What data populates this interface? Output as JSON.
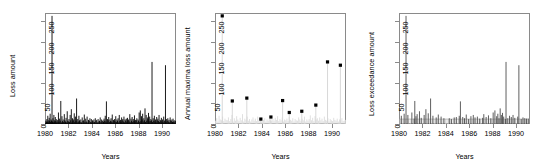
{
  "figure": {
    "kind": "multi-panel-statistical-plot",
    "panel_count": 3,
    "background": "#ffffff",
    "line_color": "#000000",
    "muted_color": "#c8c8c8",
    "axis_color": "#8a8a8a"
  },
  "chart_data": [
    {
      "type": "line",
      "panel_index": 0,
      "title": "",
      "xlabel": "Years",
      "ylabel": "Loss amount",
      "xlim": [
        1980,
        1991.2
      ],
      "ylim": [
        0,
        270
      ],
      "xticks": [
        1980,
        1982,
        1984,
        1986,
        1988,
        1990
      ],
      "yticks": [
        0,
        50,
        100,
        150,
        200,
        250
      ],
      "grid": false,
      "legend": "none",
      "series": [
        {
          "name": "Loss amount (all events)",
          "style": "impulse-spikes",
          "color": "#000000",
          "x": [
            1980.03,
            1980.08,
            1980.12,
            1980.16,
            1980.2,
            1980.24,
            1980.28,
            1980.32,
            1980.36,
            1980.4,
            1980.44,
            1980.48,
            1980.52,
            1980.56,
            1980.6,
            1980.64,
            1980.68,
            1980.72,
            1980.76,
            1980.8,
            1980.84,
            1980.88,
            1980.92,
            1980.96,
            1981.0,
            1981.05,
            1981.1,
            1981.15,
            1981.2,
            1981.25,
            1981.3,
            1981.35,
            1981.4,
            1981.45,
            1981.5,
            1981.55,
            1981.6,
            1981.65,
            1981.7,
            1981.75,
            1981.8,
            1981.85,
            1981.9,
            1981.95,
            1982.0,
            1982.05,
            1982.1,
            1982.15,
            1982.2,
            1982.25,
            1982.3,
            1982.35,
            1982.4,
            1982.45,
            1982.5,
            1982.55,
            1982.6,
            1982.65,
            1982.7,
            1982.75,
            1982.8,
            1982.85,
            1982.9,
            1982.95,
            1983.0,
            1983.06,
            1983.12,
            1983.18,
            1983.24,
            1983.3,
            1983.36,
            1983.42,
            1983.48,
            1983.54,
            1983.6,
            1983.66,
            1983.72,
            1983.78,
            1983.84,
            1983.9,
            1983.96,
            1984.0,
            1984.06,
            1984.12,
            1984.18,
            1984.24,
            1984.3,
            1984.36,
            1984.42,
            1984.48,
            1984.54,
            1984.6,
            1984.66,
            1984.72,
            1984.78,
            1984.84,
            1984.9,
            1984.96,
            1985.0,
            1985.05,
            1985.1,
            1985.15,
            1985.2,
            1985.25,
            1985.3,
            1985.35,
            1985.4,
            1985.45,
            1985.5,
            1985.55,
            1985.6,
            1985.65,
            1985.7,
            1985.75,
            1985.8,
            1985.85,
            1985.9,
            1985.95,
            1986.0,
            1986.05,
            1986.1,
            1986.15,
            1986.2,
            1986.25,
            1986.3,
            1986.35,
            1986.4,
            1986.45,
            1986.5,
            1986.55,
            1986.6,
            1986.65,
            1986.7,
            1986.75,
            1986.8,
            1986.85,
            1986.9,
            1986.95,
            1987.0,
            1987.05,
            1987.1,
            1987.15,
            1987.2,
            1987.25,
            1987.3,
            1987.35,
            1987.4,
            1987.45,
            1987.5,
            1987.55,
            1987.6,
            1987.65,
            1987.7,
            1987.75,
            1987.8,
            1987.85,
            1987.9,
            1987.95,
            1988.0,
            1988.05,
            1988.1,
            1988.15,
            1988.2,
            1988.25,
            1988.3,
            1988.35,
            1988.4,
            1988.45,
            1988.5,
            1988.55,
            1988.6,
            1988.65,
            1988.7,
            1988.75,
            1988.8,
            1988.85,
            1988.9,
            1988.95,
            1989.0,
            1989.05,
            1989.1,
            1989.15,
            1989.2,
            1989.25,
            1989.3,
            1989.35,
            1989.4,
            1989.45,
            1989.5,
            1989.55,
            1989.6,
            1989.65,
            1989.7,
            1989.75,
            1989.8,
            1989.85,
            1989.9,
            1989.95,
            1990.0,
            1990.05,
            1990.1,
            1990.15,
            1990.2,
            1990.25,
            1990.3,
            1990.35,
            1990.4,
            1990.45,
            1990.5,
            1990.55,
            1990.6,
            1990.65,
            1990.7,
            1990.75,
            1990.8,
            1990.85,
            1990.9,
            1990.95,
            1991.0,
            1991.05,
            1991.1,
            1991.15
          ],
          "y": [
            3,
            8,
            5,
            12,
            6,
            20,
            4,
            9,
            15,
            7,
            25,
            5,
            11,
            8,
            263,
            6,
            14,
            4,
            22,
            9,
            5,
            17,
            7,
            12,
            4,
            10,
            6,
            28,
            5,
            13,
            8,
            56,
            4,
            19,
            7,
            11,
            5,
            24,
            9,
            6,
            15,
            4,
            31,
            8,
            6,
            12,
            5,
            22,
            9,
            36,
            4,
            14,
            7,
            11,
            26,
            5,
            18,
            8,
            62,
            4,
            12,
            6,
            20,
            9,
            5,
            11,
            4,
            16,
            7,
            9,
            23,
            5,
            13,
            6,
            18,
            4,
            10,
            8,
            14,
            5,
            12,
            4,
            9,
            6,
            11,
            5,
            14,
            7,
            10,
            4,
            12,
            6,
            8,
            16,
            5,
            11,
            7,
            9,
            5,
            13,
            8,
            20,
            6,
            55,
            4,
            12,
            9,
            17,
            5,
            11,
            7,
            14,
            6,
            23,
            4,
            10,
            8,
            12,
            6,
            19,
            5,
            11,
            8,
            14,
            4,
            22,
            7,
            10,
            5,
            16,
            9,
            12,
            6,
            18,
            4,
            11,
            8,
            13,
            5,
            15,
            9,
            11,
            6,
            24,
            4,
            13,
            8,
            17,
            5,
            12,
            7,
            21,
            6,
            10,
            9,
            14,
            4,
            11,
            8,
            28,
            5,
            33,
            7,
            19,
            11,
            25,
            6,
            14,
            9,
            38,
            5,
            22,
            8,
            16,
            12,
            27,
            6,
            18,
            7,
            12,
            9,
            151,
            5,
            14,
            8,
            20,
            6,
            11,
            4,
            17,
            9,
            13,
            7,
            22,
            5,
            10,
            8,
            15,
            6,
            11,
            4,
            18,
            7,
            9,
            143,
            5,
            12,
            8,
            14,
            6,
            10,
            4,
            16,
            9,
            7,
            11,
            5,
            13,
            6,
            9,
            4,
            8
          ]
        }
      ]
    },
    {
      "type": "scatter",
      "panel_index": 1,
      "title": "",
      "xlabel": "Years",
      "ylabel": "Annual maxima loss amount",
      "xlim": [
        1980,
        1991.2
      ],
      "ylim": [
        0,
        270
      ],
      "xticks": [
        1980,
        1982,
        1984,
        1986,
        1988,
        1990
      ],
      "yticks": [
        0,
        50,
        100,
        150,
        200,
        250
      ],
      "grid": false,
      "legend": "none",
      "series": [
        {
          "name": "Background losses (muted)",
          "style": "impulse-spikes",
          "color": "#dcdcdc",
          "x": [
            1980.05,
            1980.15,
            1980.25,
            1980.35,
            1980.45,
            1980.55,
            1980.65,
            1980.75,
            1980.85,
            1980.95,
            1981.05,
            1981.15,
            1981.25,
            1981.35,
            1981.45,
            1981.55,
            1981.65,
            1981.75,
            1981.85,
            1981.95,
            1982.05,
            1982.15,
            1982.25,
            1982.35,
            1982.45,
            1982.55,
            1982.65,
            1982.75,
            1982.85,
            1982.95,
            1983.05,
            1983.15,
            1983.25,
            1983.35,
            1983.45,
            1983.55,
            1983.65,
            1983.75,
            1983.85,
            1983.95,
            1984.05,
            1984.15,
            1984.25,
            1984.35,
            1984.45,
            1984.55,
            1984.65,
            1984.75,
            1984.85,
            1984.95,
            1985.05,
            1985.15,
            1985.25,
            1985.35,
            1985.45,
            1985.55,
            1985.65,
            1985.75,
            1985.85,
            1985.95,
            1986.05,
            1986.15,
            1986.25,
            1986.35,
            1986.45,
            1986.55,
            1986.65,
            1986.75,
            1986.85,
            1986.95,
            1987.05,
            1987.15,
            1987.25,
            1987.35,
            1987.45,
            1987.55,
            1987.65,
            1987.75,
            1987.85,
            1987.95,
            1988.05,
            1988.15,
            1988.25,
            1988.35,
            1988.45,
            1988.55,
            1988.65,
            1988.75,
            1988.85,
            1988.95,
            1989.05,
            1989.15,
            1989.25,
            1989.35,
            1989.45,
            1989.55,
            1989.65,
            1989.75,
            1989.85,
            1989.95,
            1990.05,
            1990.15,
            1990.25,
            1990.35,
            1990.45,
            1990.55,
            1990.65,
            1990.75,
            1990.85,
            1990.95,
            1991.05,
            1991.15
          ],
          "y": [
            8,
            14,
            6,
            20,
            11,
            9,
            18,
            7,
            13,
            10,
            9,
            16,
            7,
            12,
            22,
            6,
            14,
            8,
            19,
            11,
            7,
            15,
            9,
            24,
            6,
            13,
            10,
            18,
            8,
            12,
            6,
            11,
            16,
            8,
            13,
            7,
            18,
            9,
            12,
            6,
            7,
            10,
            14,
            6,
            11,
            8,
            13,
            9,
            7,
            12,
            8,
            15,
            10,
            19,
            7,
            12,
            9,
            16,
            6,
            11,
            9,
            13,
            7,
            17,
            10,
            8,
            14,
            6,
            12,
            9,
            8,
            16,
            11,
            7,
            13,
            9,
            18,
            6,
            11,
            8,
            12,
            21,
            9,
            15,
            7,
            19,
            11,
            14,
            8,
            16,
            9,
            13,
            7,
            18,
            10,
            8,
            14,
            6,
            12,
            9,
            7,
            15,
            10,
            8,
            13,
            6,
            11,
            9,
            14,
            7,
            8,
            10
          ]
        },
        {
          "name": "Annual maxima",
          "style": "points-with-stems",
          "color": "#000000",
          "x": [
            1980.62,
            1981.48,
            1982.72,
            1983.92,
            1984.78,
            1985.78,
            1986.35,
            1987.42,
            1988.62,
            1989.62,
            1990.72,
            1991.0
          ],
          "y": [
            263,
            56,
            63,
            12,
            17,
            57,
            28,
            31,
            46,
            151,
            143,
            0
          ]
        }
      ],
      "annual_maxima_table": {
        "columns": [
          "Year",
          "Maximum loss"
        ],
        "rows": [
          [
            "1980",
            "263"
          ],
          [
            "1981",
            "56"
          ],
          [
            "1982",
            "63"
          ],
          [
            "1983",
            "12"
          ],
          [
            "1984",
            "17"
          ],
          [
            "1985",
            "57"
          ],
          [
            "1986",
            "28"
          ],
          [
            "1987",
            "31"
          ],
          [
            "1988",
            "46"
          ],
          [
            "1989",
            "151"
          ],
          [
            "1990",
            "143"
          ]
        ]
      }
    },
    {
      "type": "line",
      "panel_index": 2,
      "title": "",
      "xlabel": "Years",
      "ylabel": "Loss exceedance amount",
      "xlim": [
        1980,
        1991.2
      ],
      "ylim": [
        0,
        270
      ],
      "xticks": [
        1980,
        1982,
        1984,
        1986,
        1988,
        1990
      ],
      "yticks": [
        0,
        50,
        100,
        150,
        200,
        250
      ],
      "grid": false,
      "legend": "none",
      "threshold_band": {
        "from": 0,
        "to": 12,
        "color": "#c8c8c8"
      },
      "series": [
        {
          "name": "Threshold exceedances",
          "style": "impulse-spikes",
          "color": "#4d4d4d",
          "x": [
            1980.2,
            1980.44,
            1980.6,
            1980.76,
            1981.1,
            1981.3,
            1981.35,
            1981.45,
            1981.55,
            1981.75,
            1981.9,
            1982.15,
            1982.3,
            1982.5,
            1982.7,
            1982.9,
            1983.18,
            1983.36,
            1983.6,
            1983.84,
            1984.3,
            1984.48,
            1984.72,
            1984.9,
            1985.15,
            1985.25,
            1985.45,
            1985.6,
            1985.75,
            1985.95,
            1986.15,
            1986.35,
            1986.5,
            1986.7,
            1986.9,
            1987.15,
            1987.25,
            1987.45,
            1987.65,
            1987.85,
            1988.05,
            1988.2,
            1988.35,
            1988.45,
            1988.55,
            1988.65,
            1988.75,
            1988.85,
            1988.95,
            1989.1,
            1989.15,
            1989.3,
            1989.45,
            1989.6,
            1989.75,
            1989.9,
            1990.15,
            1990.25,
            1990.45,
            1990.6,
            1990.75,
            1990.9,
            1991.05
          ],
          "y": [
            20,
            25,
            263,
            22,
            28,
            13,
            56,
            19,
            24,
            31,
            15,
            22,
            36,
            26,
            62,
            20,
            16,
            23,
            18,
            14,
            14,
            12,
            16,
            17,
            20,
            55,
            17,
            14,
            23,
            12,
            19,
            22,
            16,
            18,
            13,
            15,
            24,
            17,
            21,
            14,
            28,
            33,
            19,
            25,
            14,
            38,
            22,
            27,
            18,
            12,
            151,
            14,
            20,
            17,
            22,
            15,
            18,
            143,
            12,
            16,
            14,
            13,
            13
          ]
        }
      ]
    }
  ]
}
